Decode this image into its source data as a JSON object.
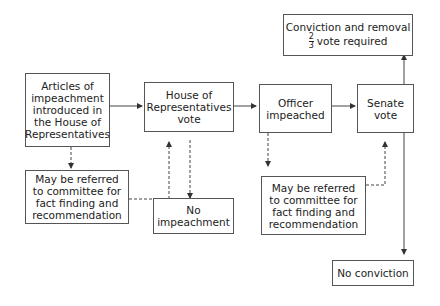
{
  "diagram": {
    "nodes": {
      "articles": "Articles of\nimpeachment\nintroduced in\nthe House of\nRepresentatives",
      "house_vote": "House of\nRepresentatives\nvote",
      "officer_impeached": "Officer\nimpeached",
      "senate_vote": "Senate\nvote",
      "committee_house": "May be referred\nto committee for\nfact finding and\nrecommendation",
      "no_impeachment": "No\nimpeachment",
      "committee_senate": "May be referred\nto committee for\nfact finding and\nrecommendation",
      "no_conviction": "No conviction",
      "conviction_title": "Conviction and removal",
      "conviction_frac_num": "2",
      "conviction_frac_den": "3",
      "conviction_sub": "vote required"
    },
    "edges": [
      {
        "from": "articles",
        "to": "house_vote",
        "style": "solid"
      },
      {
        "from": "house_vote",
        "to": "officer_impeached",
        "style": "solid"
      },
      {
        "from": "officer_impeached",
        "to": "senate_vote",
        "style": "solid"
      },
      {
        "from": "senate_vote",
        "to": "conviction",
        "style": "solid"
      },
      {
        "from": "senate_vote",
        "to": "no_conviction",
        "style": "solid"
      },
      {
        "from": "articles",
        "to": "committee_house",
        "style": "dashed"
      },
      {
        "from": "committee_house",
        "to": "house_vote",
        "style": "dashed"
      },
      {
        "from": "house_vote",
        "to": "no_impeachment",
        "style": "dashed"
      },
      {
        "from": "officer_impeached",
        "to": "committee_senate",
        "style": "dashed"
      },
      {
        "from": "committee_senate",
        "to": "senate_vote",
        "style": "dashed"
      }
    ]
  }
}
